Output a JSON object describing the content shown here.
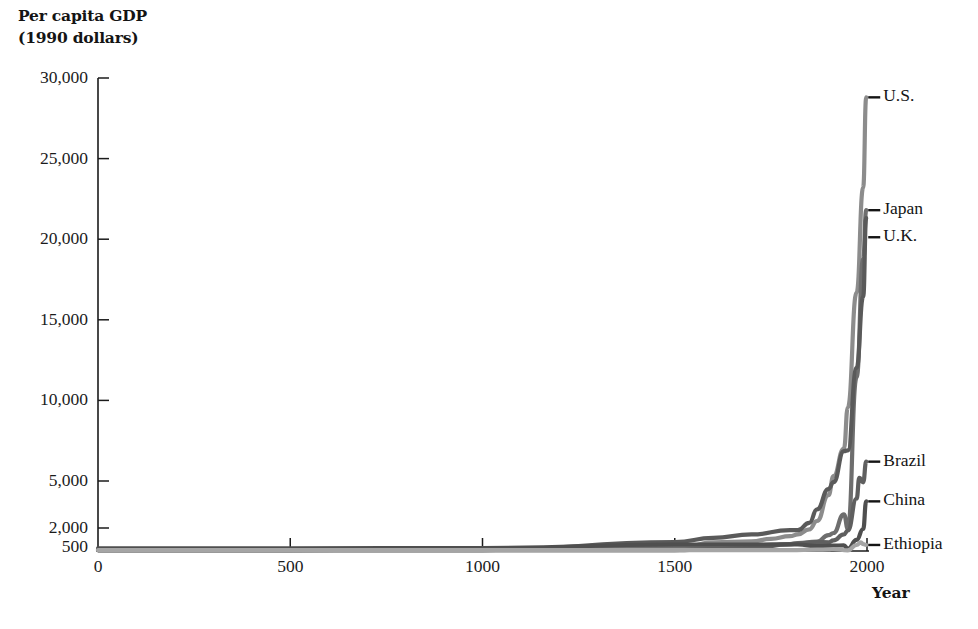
{
  "figure": {
    "background_color": "#ffffff",
    "axis_color": "#1b1b1b",
    "y_axis_title_line1": "Per capita GDP",
    "y_axis_title_line2": "(1990 dollars)",
    "x_axis_title": "Year"
  },
  "chart_data": {
    "type": "line",
    "title": "Per capita GDP (1990 dollars)",
    "xlabel": "Year",
    "ylabel": "Per capita GDP (1990 dollars)",
    "xlim": [
      0,
      2000
    ],
    "ylim": [
      500,
      30000
    ],
    "grid": false,
    "legend_position": "right-of-line-ends",
    "x_ticks": [
      0,
      500,
      1000,
      1500,
      2000
    ],
    "x_tick_labels": [
      "0",
      "500",
      "1000",
      "1500",
      "2000"
    ],
    "y_ticks": [
      500,
      2000,
      5000,
      10000,
      15000,
      20000,
      25000,
      30000
    ],
    "y_tick_labels": [
      "500",
      "2,000",
      "5,000",
      "10,000",
      "15,000",
      "20,000",
      "25,000",
      "30,000"
    ],
    "y_scale_note": "linear above 5,000; compressed between 500 and 5,000",
    "series": [
      {
        "name": "U.S.",
        "color": "#8c8c8c",
        "x": [
          0,
          500,
          1000,
          1500,
          1600,
          1700,
          1750,
          1800,
          1820,
          1850,
          1870,
          1900,
          1913,
          1940,
          1950,
          1973,
          1990,
          1998
        ],
        "values": [
          400,
          400,
          400,
          400,
          700,
          750,
          900,
          1100,
          1257,
          1800,
          2445,
          4091,
          5301,
          7010,
          9561,
          16689,
          23200,
          28800
        ]
      },
      {
        "name": "Japan",
        "color": "#6e6e6e",
        "x": [
          0,
          500,
          1000,
          1500,
          1600,
          1700,
          1800,
          1820,
          1870,
          1900,
          1913,
          1940,
          1950,
          1973,
          1990,
          1998
        ],
        "values": [
          400,
          400,
          425,
          500,
          520,
          570,
          620,
          669,
          737,
          1180,
          1387,
          2874,
          1921,
          11434,
          18789,
          21800
        ]
      },
      {
        "name": "U.K.",
        "color": "#5a5a5a",
        "x": [
          0,
          500,
          1000,
          1500,
          1600,
          1700,
          1800,
          1820,
          1850,
          1870,
          1900,
          1913,
          1940,
          1950,
          1973,
          1990,
          1998
        ],
        "values": [
          400,
          400,
          400,
          714,
          974,
          1250,
          1700,
          1707,
          2330,
          3190,
          4492,
          4921,
          6856,
          6907,
          12025,
          16430,
          21300
        ]
      },
      {
        "name": "Brazil",
        "color": "#5f5f5f",
        "x": [
          0,
          500,
          1000,
          1500,
          1600,
          1700,
          1800,
          1820,
          1870,
          1900,
          1913,
          1940,
          1950,
          1973,
          1980,
          1990,
          1998
        ],
        "values": [
          400,
          400,
          400,
          400,
          430,
          460,
          620,
          646,
          713,
          704,
          811,
          1250,
          1672,
          3882,
          5199,
          4920,
          6200
        ]
      },
      {
        "name": "China",
        "color": "#4f4f4f",
        "x": [
          0,
          500,
          1000,
          1500,
          1600,
          1700,
          1800,
          1820,
          1870,
          1900,
          1913,
          1940,
          1950,
          1973,
          1990,
          1998
        ],
        "values": [
          450,
          450,
          466,
          600,
          600,
          600,
          600,
          600,
          530,
          545,
          552,
          562,
          439,
          839,
          1858,
          3700
        ]
      },
      {
        "name": "Ethiopia",
        "color": "#a5a5a5",
        "x": [
          0,
          500,
          1000,
          1500,
          1700,
          1800,
          1870,
          1900,
          1913,
          1950,
          1973,
          1984,
          1990,
          1998
        ],
        "values": [
          400,
          400,
          400,
          400,
          400,
          400,
          410,
          420,
          430,
          390,
          580,
          700,
          620,
          580
        ]
      }
    ],
    "annotations": [
      {
        "label": "U.S.",
        "y_value": 28800
      },
      {
        "label": "Japan",
        "y_value": 21800
      },
      {
        "label": "U.K.",
        "y_value": 21300
      },
      {
        "label": "Brazil",
        "y_value": 6200
      },
      {
        "label": "China",
        "y_value": 3700
      },
      {
        "label": "Ethiopia",
        "y_value": 580
      }
    ]
  }
}
